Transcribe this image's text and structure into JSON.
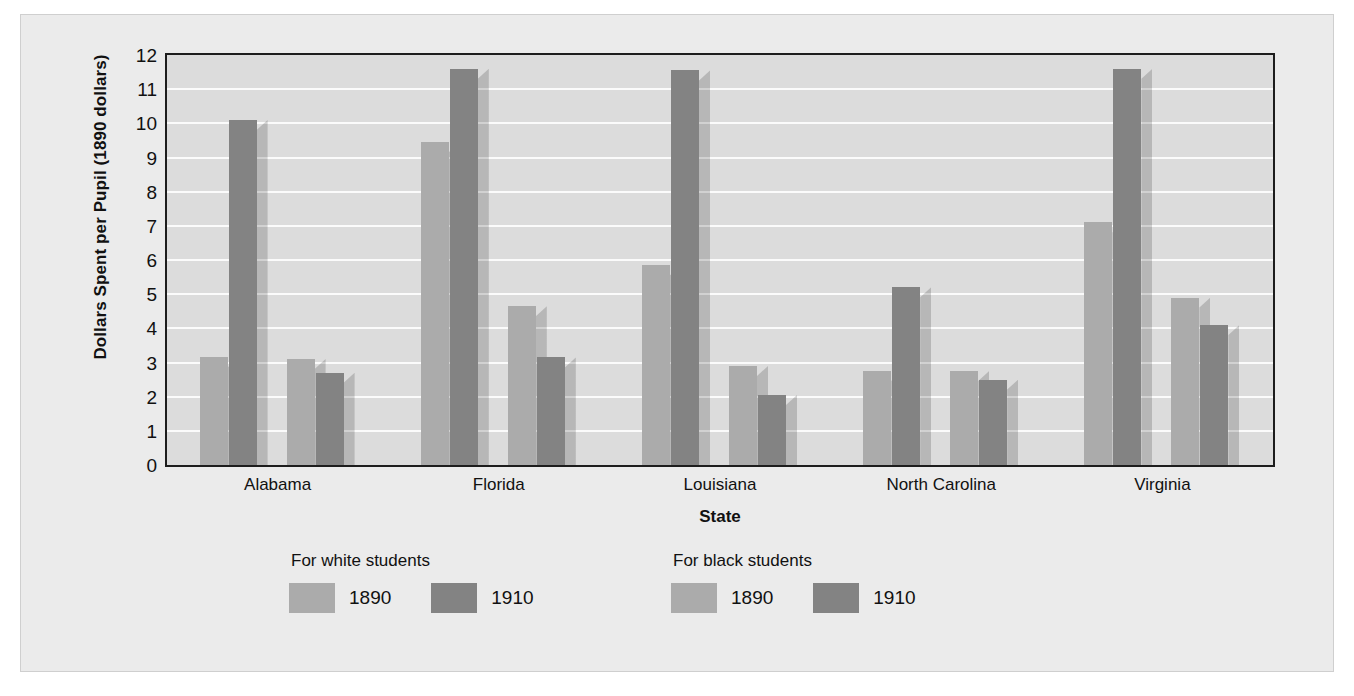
{
  "chart_data": {
    "type": "bar",
    "title": "",
    "xlabel": "State",
    "ylabel": "Dollars Spent per Pupil (1890 dollars)",
    "categories": [
      "Alabama",
      "Florida",
      "Louisiana",
      "North Carolina",
      "Virginia"
    ],
    "series": [
      {
        "name": "For white students 1890",
        "group": "For white students",
        "year": "1890",
        "color": "#ababab",
        "values": [
          3.15,
          9.45,
          5.85,
          2.75,
          7.1
        ]
      },
      {
        "name": "For white students 1910",
        "group": "For white students",
        "year": "1910",
        "color": "#838383",
        "values": [
          10.1,
          11.6,
          11.55,
          5.2,
          11.6
        ]
      },
      {
        "name": "For black students 1890",
        "group": "For black students",
        "year": "1890",
        "color": "#ababab",
        "values": [
          3.1,
          4.65,
          2.9,
          2.75,
          4.9
        ]
      },
      {
        "name": "For black students 1910",
        "group": "For black students",
        "year": "1910",
        "color": "#838383",
        "values": [
          2.7,
          3.15,
          2.05,
          2.5,
          4.1
        ]
      }
    ],
    "ylim": [
      0,
      12
    ],
    "yticks": [
      0,
      1,
      2,
      3,
      4,
      5,
      6,
      7,
      8,
      9,
      10,
      11,
      12
    ],
    "ytick_labels": [
      "0",
      "1",
      "2",
      "3",
      "4",
      "5",
      "6",
      "7",
      "8",
      "9",
      "10",
      "11",
      "12"
    ],
    "grid": true,
    "grid_axis": "y",
    "legend_position": "below-left",
    "legend": [
      {
        "title": "For white students",
        "entries": [
          {
            "label": "1890",
            "color": "#ababab"
          },
          {
            "label": "1910",
            "color": "#838383"
          }
        ]
      },
      {
        "title": "For black students",
        "entries": [
          {
            "label": "1890",
            "color": "#ababab"
          },
          {
            "label": "1910",
            "color": "#838383"
          }
        ]
      }
    ],
    "colors": {
      "plot_background": "#dcdcdc",
      "page_background": "#ebebeb",
      "gridline": "#fbfbfb",
      "axis": "#1d1d1d",
      "bar_light": "#ababab",
      "bar_dark": "#838383"
    }
  }
}
